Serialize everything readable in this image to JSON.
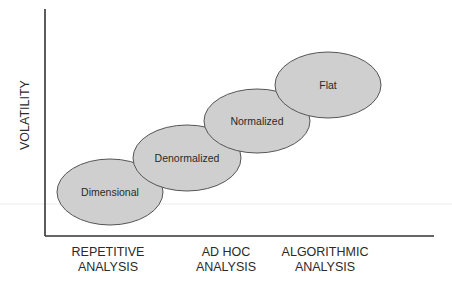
{
  "diagram": {
    "y_axis_label": "VOLATILITY",
    "x_axis_labels": [
      {
        "line1": "REPETITIVE",
        "line2": "ANALYSIS"
      },
      {
        "line1": "AD HOC",
        "line2": "ANALYSIS"
      },
      {
        "line1": "ALGORITHMIC",
        "line2": "ANALYSIS"
      }
    ],
    "nodes": [
      {
        "label": "Dimensional"
      },
      {
        "label": "Denormalized"
      },
      {
        "label": "Normalized"
      },
      {
        "label": "Flat"
      }
    ],
    "colors": {
      "ellipse_fill": "#cfcfcf",
      "ellipse_stroke": "#555555",
      "axis": "#333333",
      "text": "#2a2a2a"
    }
  }
}
